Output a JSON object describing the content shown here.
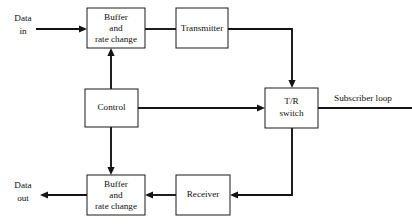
{
  "diagram": {
    "background_color": "#ffffff",
    "line_color": "#141414",
    "box_stroke_color": "#1a1a1a",
    "box_fill_color": "#ffffff",
    "text_color": "#111111",
    "nodes": [
      {
        "id": "buffer-top",
        "lines": [
          "Buffer",
          "and",
          "rate change"
        ],
        "line1": "Buffer",
        "line2": "and",
        "line3": "rate change"
      },
      {
        "id": "transmitter",
        "lines": [
          "Transmitter"
        ],
        "line1": "Transmitter"
      },
      {
        "id": "control",
        "lines": [
          "Control"
        ],
        "line1": "Control"
      },
      {
        "id": "tr-switch",
        "lines": [
          "T/R",
          "switch"
        ],
        "line1": "T/R",
        "line2": "switch"
      },
      {
        "id": "receiver",
        "lines": [
          "Receiver"
        ],
        "line1": "Receiver"
      },
      {
        "id": "buffer-bottom",
        "lines": [
          "Buffer",
          "and",
          "rate change"
        ],
        "line1": "Buffer",
        "line2": "and",
        "line3": "rate change"
      }
    ],
    "edge_labels": {
      "data_in_line1": "Data",
      "data_in_line2": "in",
      "data_out_line1": "Data",
      "data_out_line2": "out",
      "subscriber_loop": "Subscriber loop"
    },
    "edges": [
      {
        "from": "data-in",
        "to": "buffer-top",
        "arrow": true
      },
      {
        "from": "buffer-top",
        "to": "transmitter",
        "arrow": false
      },
      {
        "from": "transmitter",
        "to": "tr-switch",
        "arrow": true
      },
      {
        "from": "control",
        "to": "buffer-top",
        "arrow": true
      },
      {
        "from": "control",
        "to": "tr-switch",
        "arrow": true
      },
      {
        "from": "control",
        "to": "buffer-bottom",
        "arrow": true
      },
      {
        "from": "tr-switch",
        "to": "subscriber-loop",
        "arrow": false
      },
      {
        "from": "tr-switch",
        "to": "receiver",
        "arrow": true
      },
      {
        "from": "receiver",
        "to": "buffer-bottom",
        "arrow": true
      },
      {
        "from": "buffer-bottom",
        "to": "data-out",
        "arrow": true
      }
    ]
  }
}
